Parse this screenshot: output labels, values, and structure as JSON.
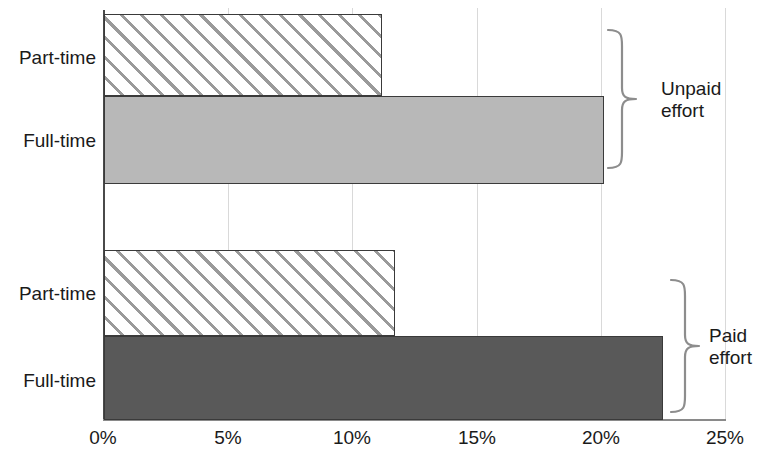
{
  "chart_data": {
    "type": "bar",
    "orientation": "horizontal",
    "title": "",
    "xlabel": "",
    "ylabel": "",
    "xlim": [
      0,
      25
    ],
    "x_unit": "%",
    "grid": true,
    "legend_position": "none",
    "x_ticks": [
      {
        "value": 0,
        "label": "0%"
      },
      {
        "value": 5,
        "label": "5%"
      },
      {
        "value": 10,
        "label": "10%"
      },
      {
        "value": 15,
        "label": "15%"
      },
      {
        "value": 20,
        "label": "20%"
      },
      {
        "value": 25,
        "label": "25%"
      }
    ],
    "groups": [
      {
        "name": "Unpaid effort",
        "label_line1": "Unpaid",
        "label_line2": "effort",
        "bars": [
          {
            "category": "Part-time",
            "value": 11.2,
            "style": "hatched",
            "color": "#ffffff"
          },
          {
            "category": "Full-time",
            "value": 20.1,
            "style": "solid",
            "color": "#b8b8b8"
          }
        ]
      },
      {
        "name": "Paid effort",
        "label_line1": "Paid",
        "label_line2": "effort",
        "bars": [
          {
            "category": "Part-time",
            "value": 11.7,
            "style": "hatched",
            "color": "#ffffff"
          },
          {
            "category": "Full-time",
            "value": 22.5,
            "style": "solid",
            "color": "#595959"
          }
        ]
      }
    ],
    "categories": [
      "Part-time",
      "Full-time",
      "Part-time",
      "Full-time"
    ],
    "values": [
      11.2,
      20.1,
      11.7,
      22.5
    ],
    "colors": {
      "hatch_line": "#9a9a9a",
      "light_fill": "#b8b8b8",
      "dark_fill": "#595959",
      "bar_border": "#3a3a3a",
      "gridline": "#d9d9d9",
      "axis": "#4a4a4a",
      "brace": "#8d8d8d",
      "text": "#1a1a1a"
    }
  }
}
